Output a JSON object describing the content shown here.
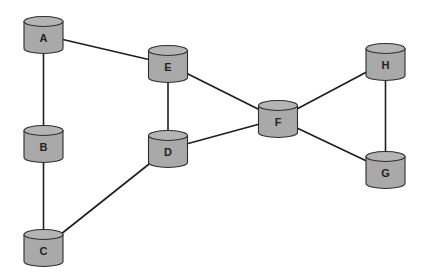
{
  "diagram": {
    "type": "network-graph",
    "node_shape": "cylinder",
    "colors": {
      "node_fill": "#a9a9a9",
      "node_top": "#b4b4b4",
      "node_stroke": "#2e2e2e",
      "edge": "#1e1e1e",
      "background": "#ffffff"
    },
    "nodes": [
      {
        "id": "A",
        "label": "A",
        "x": 43.5,
        "y": 35
      },
      {
        "id": "B",
        "label": "B",
        "x": 43.5,
        "y": 144
      },
      {
        "id": "C",
        "label": "C",
        "x": 43.5,
        "y": 248
      },
      {
        "id": "E",
        "label": "E",
        "x": 168,
        "y": 64
      },
      {
        "id": "D",
        "label": "D",
        "x": 168,
        "y": 149
      },
      {
        "id": "F",
        "label": "F",
        "x": 278,
        "y": 119
      },
      {
        "id": "H",
        "label": "H",
        "x": 385.5,
        "y": 62
      },
      {
        "id": "G",
        "label": "G",
        "x": 385.5,
        "y": 170
      }
    ],
    "edges": [
      {
        "from": "A",
        "to": "E"
      },
      {
        "from": "A",
        "to": "B"
      },
      {
        "from": "B",
        "to": "C"
      },
      {
        "from": "C",
        "to": "D"
      },
      {
        "from": "D",
        "to": "E"
      },
      {
        "from": "E",
        "to": "F"
      },
      {
        "from": "D",
        "to": "F"
      },
      {
        "from": "F",
        "to": "H"
      },
      {
        "from": "F",
        "to": "G"
      },
      {
        "from": "H",
        "to": "G"
      }
    ]
  }
}
